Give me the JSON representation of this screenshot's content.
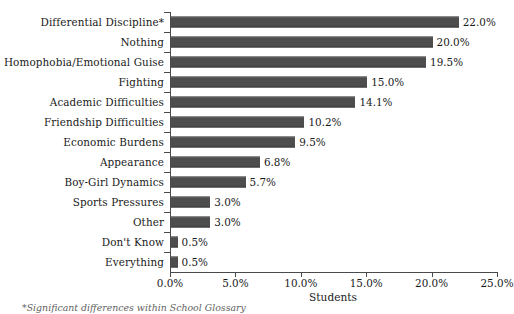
{
  "chart_data": {
    "type": "bar",
    "orientation": "horizontal",
    "title": "",
    "xlabel": "Students",
    "ylabel": "",
    "xlim": [
      0,
      25
    ],
    "xticks": [
      "0.0%",
      "5.0%",
      "10.0%",
      "15.0%",
      "20.0%",
      "25.0%"
    ],
    "xtick_values": [
      0,
      5,
      10,
      15,
      20,
      25
    ],
    "grid": false,
    "legend": false,
    "bar_color": "#4d4d4d",
    "categories": [
      "Differential Discipline*",
      "Nothing",
      "Homophobia/Emotional Guise",
      "Fighting",
      "Academic Difficulties",
      "Friendship Difficulties",
      "Economic Burdens",
      "Appearance",
      "Boy-Girl Dynamics",
      "Sports Pressures",
      "Other",
      "Don't Know",
      "Everything"
    ],
    "values": [
      22.0,
      20.0,
      19.5,
      15.0,
      14.1,
      10.2,
      9.5,
      6.8,
      5.7,
      3.0,
      3.0,
      0.5,
      0.5
    ],
    "value_labels": [
      "22.0%",
      "20.0%",
      "19.5%",
      "15.0%",
      "14.1%",
      "10.2%",
      "9.5%",
      "6.8%",
      "5.7%",
      "3.0%",
      "3.0%",
      "0.5%",
      "0.5%"
    ]
  },
  "footnote": "*Significant differences within School Glossary"
}
